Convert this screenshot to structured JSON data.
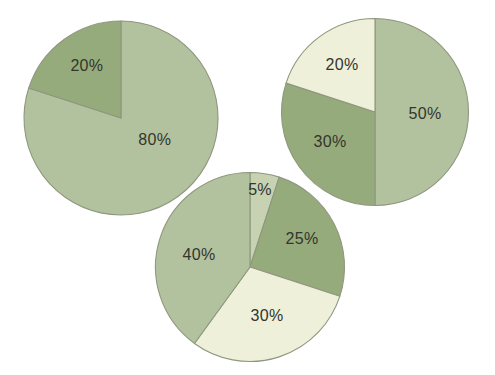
{
  "page": {
    "background": "#ffffff"
  },
  "palette": {
    "light_sage": "#b3c29e",
    "dark_sage": "#96ab7b",
    "cream": "#eef0d9",
    "pale_sage": "#c6d2b2",
    "stroke": "#8f977f",
    "label_color": "#33352e"
  },
  "chart_data": [
    {
      "type": "pie",
      "name": "pie-top-left",
      "title": "",
      "legend": "none",
      "start_angle_deg": 0,
      "direction": "clockwise",
      "center": {
        "x": 121,
        "y": 118
      },
      "radius": 97,
      "categories": [
        "80%",
        "20%"
      ],
      "values": [
        80,
        20
      ],
      "slices": [
        {
          "label": "80%",
          "value": 80,
          "color": "light_sage",
          "label_angle_deg": 121.7,
          "label_r_frac": 0.41
        },
        {
          "label": "20%",
          "value": 20,
          "color": "dark_sage",
          "label_angle_deg": 327.3,
          "label_r_frac": 0.65
        }
      ]
    },
    {
      "type": "pie",
      "name": "pie-top-right",
      "title": "",
      "legend": "none",
      "start_angle_deg": 0,
      "direction": "clockwise",
      "center": {
        "x": 375,
        "y": 112
      },
      "radius": 93.5,
      "categories": [
        "50%",
        "30%",
        "20%"
      ],
      "values": [
        50,
        30,
        20
      ],
      "slices": [
        {
          "label": "50%",
          "value": 50,
          "color": "light_sage",
          "label_angle_deg": 91.0,
          "label_r_frac": 0.535
        },
        {
          "label": "30%",
          "value": 30,
          "color": "dark_sage",
          "label_angle_deg": 237.3,
          "label_r_frac": 0.572
        },
        {
          "label": "20%",
          "value": 20,
          "color": "cream",
          "label_angle_deg": 325.5,
          "label_r_frac": 0.623
        }
      ]
    },
    {
      "type": "pie",
      "name": "pie-bottom-center",
      "title": "",
      "legend": "none",
      "start_angle_deg": 0,
      "direction": "clockwise",
      "center": {
        "x": 250,
        "y": 267
      },
      "radius": 94.5,
      "categories": [
        "5%",
        "25%",
        "30%",
        "40%"
      ],
      "values": [
        5,
        25,
        30,
        40
      ],
      "slices": [
        {
          "label": "5%",
          "value": 5,
          "color": "pale_sage",
          "label_angle_deg": 7.3,
          "label_r_frac": 0.83
        },
        {
          "label": "25%",
          "value": 25,
          "color": "dark_sage",
          "label_angle_deg": 60.9,
          "label_r_frac": 0.63
        },
        {
          "label": "30%",
          "value": 30,
          "color": "cream",
          "label_angle_deg": 160.5,
          "label_r_frac": 0.54
        },
        {
          "label": "40%",
          "value": 40,
          "color": "light_sage",
          "label_angle_deg": 284.3,
          "label_r_frac": 0.557
        }
      ]
    }
  ]
}
